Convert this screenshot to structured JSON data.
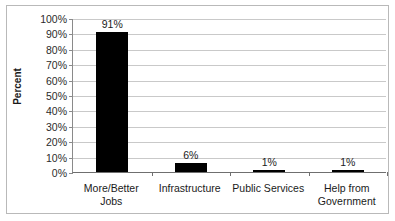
{
  "chart_data": {
    "type": "bar",
    "title": "",
    "xlabel": "",
    "ylabel": "Percent",
    "categories": [
      "More/Better Jobs",
      "Infrastructure",
      "Public Services",
      "Help from Government"
    ],
    "category_lines": [
      [
        "More/Better",
        "Jobs"
      ],
      [
        "Infrastructure",
        ""
      ],
      [
        "Public Services",
        ""
      ],
      [
        "Help from",
        "Government"
      ]
    ],
    "values": [
      91,
      6,
      1,
      1
    ],
    "value_labels": [
      "91%",
      "6%",
      "1%",
      "1%"
    ],
    "ylim": [
      0,
      100
    ],
    "ytick_values": [
      100,
      90,
      80,
      70,
      60,
      50,
      40,
      30,
      20,
      10,
      0
    ],
    "ytick_labels": [
      "100%",
      "90%",
      "80%",
      "70%",
      "60%",
      "50%",
      "40%",
      "30%",
      "20%",
      "10%",
      "0%"
    ],
    "grid": true,
    "legend": false,
    "bar_color": "#000000",
    "gridline_color": "#c9c9c9",
    "axis_color": "#6f6f6f",
    "frame_color": "#b9b9b9",
    "background": "#ffffff"
  }
}
